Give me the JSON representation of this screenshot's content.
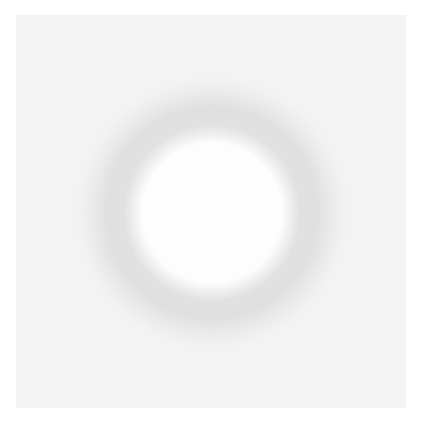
{
  "image": {
    "description": "Grayscale noisy image of a dark circular ring on a speckled background",
    "background_color": "#ffffff",
    "noise_base_color": "#d9d9d9",
    "speck_color": "#333333",
    "ring_color": "#2b2b2b",
    "inner_color": "#f2f2f2",
    "panel": {
      "x": 16,
      "y": 15,
      "width": 390,
      "height": 393
    },
    "ring": {
      "cx": 196,
      "cy": 198,
      "inner_r": 80,
      "outer_r": 118
    }
  }
}
